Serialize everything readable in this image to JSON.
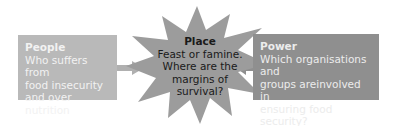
{
  "diagram": {
    "left_box": {
      "title": "People",
      "lines": [
        "Who suffers from",
        "food insecurity",
        "and over nutrition"
      ],
      "color": "#b9b9b9"
    },
    "center_star": {
      "title": "Place",
      "lines": [
        "Feast or famine.",
        "Where are the",
        "margins of",
        "survival?"
      ],
      "color": "#9c9c9c"
    },
    "right_box": {
      "title": "Power",
      "lines": [
        "Which organisations and",
        "groups areinvolved in",
        "ensuring food security?"
      ],
      "color": "#8f8f8f"
    },
    "arrows": [
      {
        "from": "left_box",
        "to": "center_star"
      },
      {
        "from": "right_box",
        "to": "center_star"
      }
    ]
  }
}
